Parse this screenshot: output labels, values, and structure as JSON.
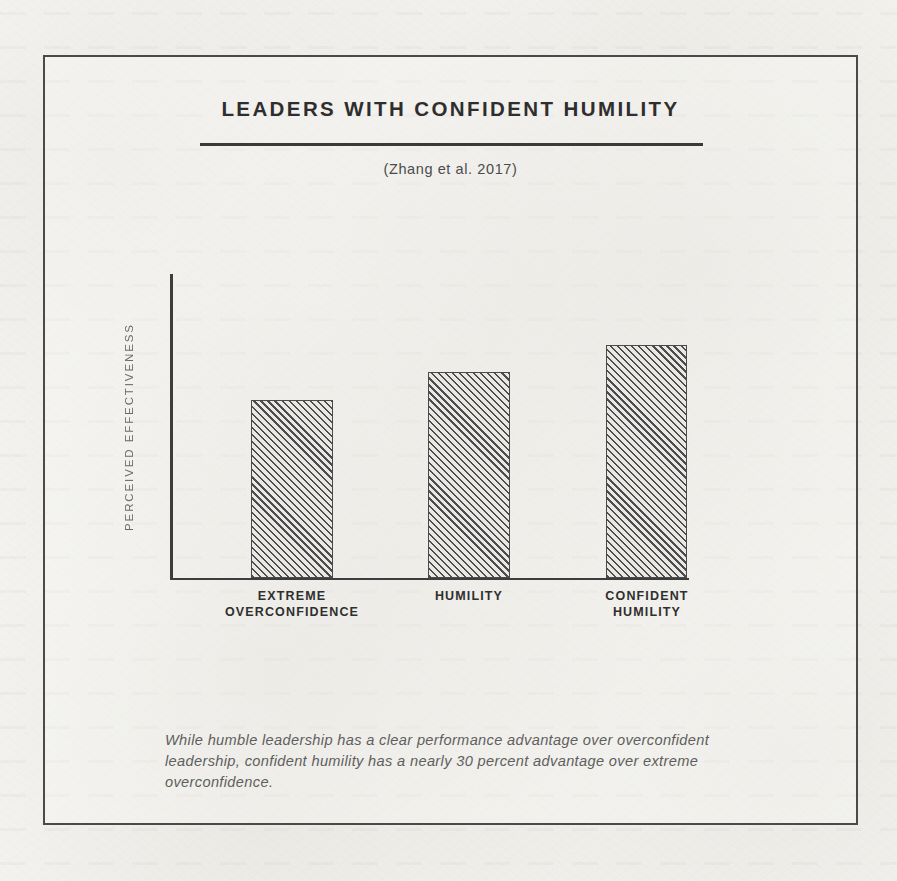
{
  "figure": {
    "title": "LEADERS WITH CONFIDENT HUMILITY",
    "subtitle": "(Zhang et al. 2017)",
    "caption": "While humble leadership has a clear performance advantage over overconfident leadership, confident humility has a nearly 30 percent advantage over extreme overconfidence.",
    "frame_color": "#4a4a4a",
    "ink_color": "#3a3a3a",
    "paper_color": "#f2f1ed"
  },
  "chart_data": {
    "type": "bar",
    "title": "LEADERS WITH CONFIDENT HUMILITY",
    "subtitle": "(Zhang et al. 2017)",
    "categories": [
      "EXTREME OVERCONFIDENCE",
      "HUMILITY",
      "CONFIDENT HUMILITY"
    ],
    "category_lines": [
      [
        "EXTREME",
        "OVERCONFIDENCE"
      ],
      [
        "HUMILITY",
        ""
      ],
      [
        "CONFIDENT",
        "HUMILITY"
      ]
    ],
    "values": [
      100,
      115,
      130
    ],
    "bar_pixel_heights": [
      178,
      206,
      233
    ],
    "xlabel": "",
    "ylabel": "PERCEIVED EFFECTIVENESS",
    "ylim": [
      0,
      170
    ],
    "grid": false,
    "legend": false,
    "axis_tick_values_shown": false,
    "bar_fill": "diagonal-hatch",
    "annotation": "While humble leadership has a clear performance advantage over overconfident leadership, confident humility has a nearly 30 percent advantage over extreme overconfidence.",
    "bar_geometry": [
      {
        "left": 81,
        "width": 82,
        "height": 178
      },
      {
        "left": 258,
        "width": 82,
        "height": 206
      },
      {
        "left": 436,
        "width": 81,
        "height": 233
      }
    ],
    "tick_geometry": [
      {
        "left": 42,
        "width": 160
      },
      {
        "left": 219,
        "width": 160
      },
      {
        "left": 397,
        "width": 160
      }
    ]
  }
}
